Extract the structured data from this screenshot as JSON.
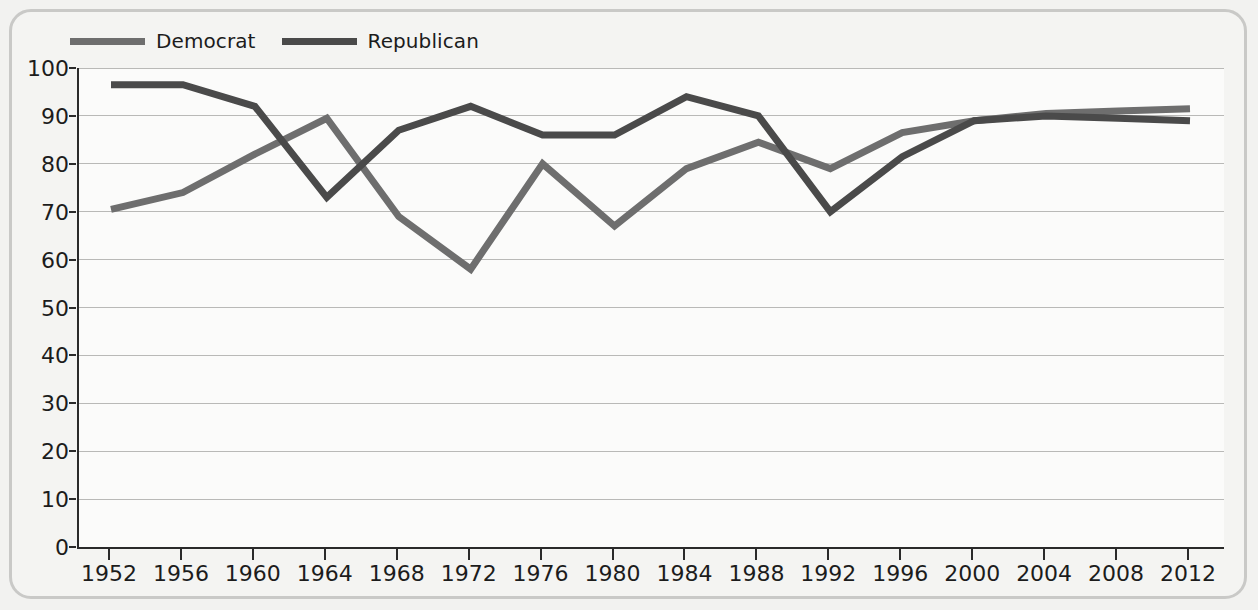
{
  "chart_data": {
    "type": "line",
    "title": "",
    "subtitle": "",
    "xlabel": "",
    "ylabel": "",
    "xlim": [
      1952,
      2012
    ],
    "ylim": [
      0,
      100
    ],
    "grid": true,
    "legend_position": "top-left",
    "categories": [
      "1952",
      "1956",
      "1960",
      "1964",
      "1968",
      "1972",
      "1976",
      "1980",
      "1984",
      "1988",
      "1992",
      "1996",
      "2000",
      "2004",
      "2008",
      "2012"
    ],
    "x": [
      1952,
      1956,
      1960,
      1964,
      1968,
      1972,
      1976,
      1980,
      1984,
      1988,
      1992,
      1996,
      2000,
      2004,
      2008,
      2012
    ],
    "x_tick_labels": [
      "1952",
      "1956",
      "1960",
      "1964",
      "1968",
      "1972",
      "1976",
      "1980",
      "1984",
      "1988",
      "1992",
      "1996",
      "2000",
      "2004",
      "2008",
      "2012"
    ],
    "y_tick_labels": [
      "0",
      "10",
      "20",
      "30",
      "40",
      "50",
      "60",
      "70",
      "80",
      "90",
      "100"
    ],
    "y_ticks": [
      0,
      10,
      20,
      30,
      40,
      50,
      60,
      70,
      80,
      90,
      100
    ],
    "series": [
      {
        "name": "Democrat",
        "color": "#6e6e6e",
        "values": [
          70.5,
          74,
          82,
          89.5,
          69,
          58,
          80,
          67,
          79,
          84.5,
          79,
          86.5,
          89,
          90.5,
          91,
          91.5
        ]
      },
      {
        "name": "Republican",
        "color": "#4a4a4a",
        "values": [
          96.5,
          96.5,
          92,
          73,
          87,
          92,
          86,
          86,
          94,
          90,
          70,
          81.5,
          89,
          90,
          89.5,
          89
        ]
      }
    ]
  },
  "legend": {
    "items": [
      {
        "label": "Democrat",
        "color": "#6e6e6e"
      },
      {
        "label": "Republican",
        "color": "#4a4a4a"
      }
    ]
  },
  "colors": {
    "democrat": "#6e6e6e",
    "republican": "#4a4a4a",
    "gridline": "#b9b9b7",
    "axis": "#2a2a2a",
    "plot_background": "#fbfbfa",
    "figure_background": "#f4f4f2",
    "frame_border": "#c9c9c7",
    "text": "#1c1c1c"
  }
}
